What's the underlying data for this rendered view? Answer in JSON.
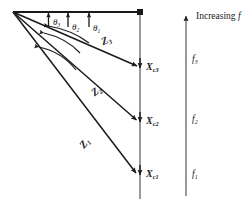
{
  "figure": {
    "stroke_color": "#1a1a1a",
    "background": "#ffffff",
    "apex": {
      "x": 13,
      "y": 12
    },
    "horizontal_axis_end": {
      "x": 140,
      "y": 12
    }
  },
  "angles": {
    "theta1": {
      "label_main": "θ",
      "label_sub": "1"
    },
    "theta2": {
      "label_main": "θ",
      "label_sub": "2"
    },
    "theta3": {
      "label_main": "θ",
      "label_sub": "3"
    }
  },
  "vectors": {
    "z3": {
      "label_main": "Z",
      "label_sub": "3"
    },
    "z2": {
      "label_main": "Z",
      "label_sub": "2"
    },
    "z1": {
      "label_main": "Z",
      "label_sub": "1"
    }
  },
  "points": {
    "xc3": {
      "label_main": "X",
      "label_sub": "c3"
    },
    "xc2": {
      "label_main": "X",
      "label_sub": "c2"
    },
    "xc1": {
      "label_main": "X",
      "label_sub": "c1"
    }
  },
  "frequency_axis": {
    "caption_text": "Increasing ",
    "caption_symbol": "f",
    "f3": {
      "label_main": "f",
      "label_sub": "3"
    },
    "f2": {
      "label_main": "f",
      "label_sub": "2"
    },
    "f1": {
      "label_main": "f",
      "label_sub": "1"
    }
  }
}
